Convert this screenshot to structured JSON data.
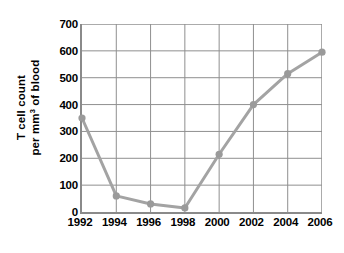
{
  "chart_data": {
    "type": "line",
    "title": "",
    "xlabel": "",
    "ylabel_line1": "T cell count",
    "ylabel_line2_prefix": "per mm",
    "ylabel_line2_sup": "3",
    "ylabel_line2_suffix": " of blood",
    "ylabel": "T cell count per mm3 of blood",
    "categories": [
      "1992",
      "1994",
      "1996",
      "1998",
      "2000",
      "2002",
      "2004",
      "2006"
    ],
    "x": [
      1992,
      1994,
      1996,
      1998,
      2000,
      2002,
      2004,
      2006
    ],
    "values": [
      350,
      60,
      30,
      15,
      215,
      400,
      515,
      595
    ],
    "xlim": [
      1992,
      2006
    ],
    "ylim": [
      0,
      700
    ],
    "y_ticks": [
      0,
      100,
      200,
      300,
      400,
      500,
      600,
      700
    ],
    "y_tick_labels": [
      "0",
      "100",
      "200",
      "300",
      "400",
      "500",
      "600",
      "700"
    ],
    "x_ticks": [
      1992,
      1994,
      1996,
      1998,
      2000,
      2002,
      2004,
      2006
    ],
    "x_tick_labels": [
      "1992",
      "1994",
      "1996",
      "1998",
      "2000",
      "2002",
      "2004",
      "2006"
    ],
    "grid": true,
    "legend": false,
    "legend_position": "none",
    "series": [
      {
        "name": "T cell count",
        "values": [
          350,
          60,
          30,
          15,
          215,
          400,
          515,
          595
        ]
      }
    ],
    "colors": {
      "line": "#a3a3a3",
      "marker": "#9a9a9a",
      "grid": "#8f8f8f",
      "axis": "#8a8a8a",
      "text": "#000000",
      "background": "#ffffff"
    },
    "style": {
      "line_width": 3,
      "marker_radius": 3.6,
      "marker_shape": "circle"
    }
  }
}
